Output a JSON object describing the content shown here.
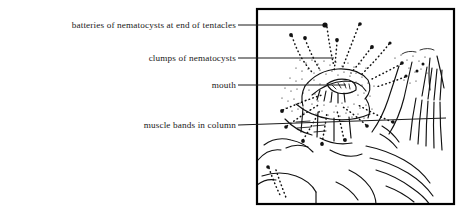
{
  "figure": {
    "kind": "labelled-biological-illustration",
    "background_color": "#ffffff",
    "ink_color": "#111111",
    "frame": {
      "name": "illustration-frame",
      "x": 256,
      "y": 8,
      "width": 199,
      "height": 197,
      "border_color": "#000000",
      "border_width": 2
    }
  },
  "labels": [
    {
      "id": "batteries",
      "text": "batteries of nematocysts at end of tentacles",
      "text_right_x": 236,
      "baseline_y": 29,
      "leader": {
        "x1": 238,
        "y1": 25,
        "x2": 325,
        "y2": 25
      },
      "endpoint": {
        "x": 325,
        "y": 25,
        "marker": "filled-dot",
        "r": 2.6
      }
    },
    {
      "id": "clumps",
      "text": "clumps of nematocysts",
      "text_right_x": 236,
      "baseline_y": 62,
      "leader": {
        "x1": 238,
        "y1": 58,
        "x2": 334,
        "y2": 58
      },
      "endpoint": {
        "x": 334,
        "y": 58,
        "marker": "none",
        "r": 0
      }
    },
    {
      "id": "mouth",
      "text": "mouth",
      "text_right_x": 236,
      "baseline_y": 89,
      "leader": {
        "x1": 238,
        "y1": 85,
        "x2": 346,
        "y2": 85
      },
      "endpoint": {
        "x": 346,
        "y": 85,
        "marker": "none",
        "r": 0
      }
    },
    {
      "id": "muscle",
      "text": "muscle bands in column",
      "text_right_x": 236,
      "baseline_y": 129,
      "leader": {
        "x1": 238,
        "y1": 125,
        "x2": 446,
        "y2": 118
      },
      "endpoint": {
        "x": 446,
        "y": 118,
        "marker": "none",
        "r": 0
      }
    }
  ],
  "illustration_notes": {
    "tentacles": "dotted/stippled tentacles radiating upward and outward from the oral disc, each tipped by a small solid nematocyst battery dot",
    "oral_disc": "central puckered mouth with radiating lip folds",
    "column": "broad column below the disc with longitudinal muscle bands",
    "substrate": "flowing hatched line work at right suggesting rock and adjacent anemone"
  }
}
